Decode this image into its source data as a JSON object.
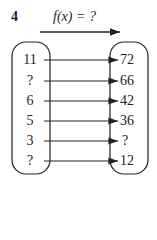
{
  "problem_number": "4",
  "function_label": "f(x) = ?",
  "mapping": {
    "inputs": [
      "11",
      "?",
      "6",
      "5",
      "3",
      "?"
    ],
    "outputs": [
      "72",
      "66",
      "42",
      "36",
      "?",
      "12"
    ]
  }
}
